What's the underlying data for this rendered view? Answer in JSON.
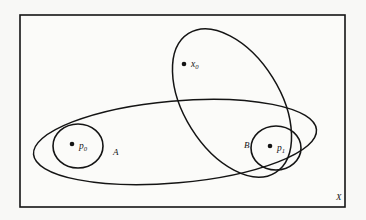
{
  "figure": {
    "type": "set-diagram",
    "background_color": "#f8f8f6",
    "ink_color": "#141414",
    "canvas": {
      "width": 366,
      "height": 220
    },
    "universe": {
      "label": "X",
      "label_position": {
        "x": 336,
        "y": 200
      },
      "rect": {
        "x": 20,
        "y": 15,
        "width": 325,
        "height": 192
      }
    },
    "regions": [
      {
        "name": "big-ellipse",
        "label": "",
        "shape": "ellipse",
        "cx": 232,
        "cy": 103,
        "rx": 48,
        "ry": 82,
        "rotation": -32
      },
      {
        "name": "wide-ellipse",
        "label": "",
        "shape": "ellipse",
        "cx": 175,
        "cy": 142,
        "rx": 142,
        "ry": 41,
        "rotation": -5
      },
      {
        "name": "set-a",
        "label": "A",
        "label_position": {
          "x": 113,
          "y": 155
        },
        "shape": "ellipse",
        "cx": 78,
        "cy": 146,
        "rx": 25,
        "ry": 22,
        "rotation": 0
      },
      {
        "name": "set-b",
        "label": "B",
        "label_position": {
          "x": 244,
          "y": 148
        },
        "shape": "ellipse",
        "cx": 276,
        "cy": 148,
        "rx": 25,
        "ry": 22,
        "rotation": 0
      }
    ],
    "points": [
      {
        "name": "x0",
        "label": "x",
        "subscript": "0",
        "x": 184,
        "y": 64,
        "radius": 2.3,
        "label_position": {
          "x": 191,
          "y": 67
        }
      },
      {
        "name": "p0",
        "label": "p",
        "subscript": "0",
        "x": 72,
        "y": 144,
        "radius": 2.3,
        "label_position": {
          "x": 79,
          "y": 149
        }
      },
      {
        "name": "p1",
        "label": "p",
        "subscript": "1",
        "x": 270,
        "y": 146,
        "radius": 2.3,
        "label_position": {
          "x": 277,
          "y": 151
        }
      }
    ]
  }
}
